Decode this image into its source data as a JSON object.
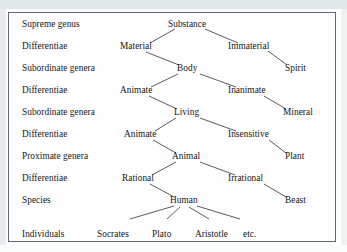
{
  "figure": {
    "border_color": "#5a6a70",
    "text_color": "#141414",
    "line_color": "#4a4a4a",
    "background": "#fefefe",
    "scan_strip_color": "#dfe7e9"
  },
  "row_labels": [
    {
      "text": "Supreme genus",
      "x": 22,
      "y": 19
    },
    {
      "text": "Differentiae",
      "x": 22,
      "y": 41
    },
    {
      "text": "Subordinate genera",
      "x": 22,
      "y": 63
    },
    {
      "text": "Differentiae",
      "x": 22,
      "y": 85
    },
    {
      "text": "Subordinate genera",
      "x": 22,
      "y": 107
    },
    {
      "text": "Differentiae",
      "x": 22,
      "y": 129
    },
    {
      "text": "Proximate genera",
      "x": 22,
      "y": 151
    },
    {
      "text": "Differentiae",
      "x": 22,
      "y": 173
    },
    {
      "text": "Species",
      "x": 22,
      "y": 195
    },
    {
      "text": "Individuals",
      "x": 22,
      "y": 229
    }
  ],
  "nodes": [
    {
      "id": "substance",
      "text": "Substance",
      "x": 168,
      "y": 19,
      "cx": 189,
      "cy": 25
    },
    {
      "id": "material",
      "text": "Material",
      "x": 120,
      "y": 41,
      "cx": 138,
      "cy": 47
    },
    {
      "id": "immaterial",
      "text": "Immaterial",
      "x": 228,
      "y": 41,
      "cx": 250,
      "cy": 47
    },
    {
      "id": "body",
      "text": "Body",
      "x": 177,
      "y": 63,
      "cx": 188,
      "cy": 69
    },
    {
      "id": "spirit",
      "text": "Spirit",
      "x": 285,
      "y": 63,
      "cx": 297,
      "cy": 69
    },
    {
      "id": "animate-1",
      "text": "Animate",
      "x": 120,
      "y": 85,
      "cx": 139,
      "cy": 91
    },
    {
      "id": "inanimate",
      "text": "Inanimate",
      "x": 228,
      "y": 85,
      "cx": 248,
      "cy": 91
    },
    {
      "id": "living",
      "text": "Living",
      "x": 174,
      "y": 107,
      "cx": 187,
      "cy": 113
    },
    {
      "id": "mineral",
      "text": "Mineral",
      "x": 283,
      "y": 107,
      "cx": 298,
      "cy": 113
    },
    {
      "id": "animate-2",
      "text": "Animate",
      "x": 124,
      "y": 129,
      "cx": 143,
      "cy": 135
    },
    {
      "id": "insensitive",
      "text": "Insensitive",
      "x": 228,
      "y": 129,
      "cx": 251,
      "cy": 135
    },
    {
      "id": "animal",
      "text": "Animal",
      "x": 172,
      "y": 151,
      "cx": 187,
      "cy": 157
    },
    {
      "id": "plant",
      "text": "Plant",
      "x": 285,
      "y": 151,
      "cx": 296,
      "cy": 157
    },
    {
      "id": "rational",
      "text": "Rational",
      "x": 122,
      "y": 173,
      "cx": 140,
      "cy": 179
    },
    {
      "id": "irrational",
      "text": "Irrational",
      "x": 228,
      "y": 173,
      "cx": 248,
      "cy": 179
    },
    {
      "id": "human",
      "text": "Human",
      "x": 170,
      "y": 195,
      "cx": 185,
      "cy": 201
    },
    {
      "id": "beast",
      "text": "Beast",
      "x": 285,
      "y": 195,
      "cx": 296,
      "cy": 201
    }
  ],
  "individuals": [
    {
      "id": "socrates",
      "text": "Socrates",
      "x": 97,
      "y": 229,
      "cx": 116,
      "cy": 224
    },
    {
      "id": "plato",
      "text": "Plato",
      "x": 152,
      "y": 229,
      "cx": 163,
      "cy": 224
    },
    {
      "id": "aristotle",
      "text": "Aristotle",
      "x": 195,
      "y": 229,
      "cx": 215,
      "cy": 224
    },
    {
      "id": "etc",
      "text": "etc.",
      "x": 243,
      "y": 229,
      "cx": 250,
      "cy": 224
    }
  ],
  "chart_data": {
    "type": "tree",
    "levels": [
      "Supreme genus",
      "Differentiae",
      "Subordinate genera",
      "Differentiae",
      "Subordinate genera",
      "Differentiae",
      "Proximate genera",
      "Differentiae",
      "Species",
      "Individuals"
    ],
    "edges": [
      [
        "Substance",
        "Material"
      ],
      [
        "Substance",
        "Immaterial"
      ],
      [
        "Immaterial",
        "Spirit"
      ],
      [
        "Material",
        "Body"
      ],
      [
        "Body",
        "Animate"
      ],
      [
        "Body",
        "Inanimate"
      ],
      [
        "Inanimate",
        "Mineral"
      ],
      [
        "Animate",
        "Living"
      ],
      [
        "Living",
        "Animate"
      ],
      [
        "Living",
        "Insensitive"
      ],
      [
        "Insensitive",
        "Plant"
      ],
      [
        "Animate",
        "Animal"
      ],
      [
        "Animal",
        "Rational"
      ],
      [
        "Animal",
        "Irrational"
      ],
      [
        "Irrational",
        "Beast"
      ],
      [
        "Rational",
        "Human"
      ],
      [
        "Human",
        "Socrates"
      ],
      [
        "Human",
        "Plato"
      ],
      [
        "Human",
        "Aristotle"
      ],
      [
        "Human",
        "etc."
      ]
    ]
  }
}
